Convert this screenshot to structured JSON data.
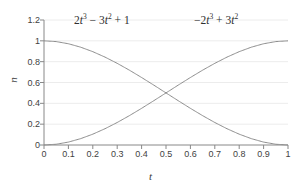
{
  "chart_data": {
    "type": "line",
    "title": "",
    "xlabel": "t",
    "ylabel": "n",
    "xlim": [
      0,
      1
    ],
    "ylim": [
      0,
      1.2
    ],
    "grid": true,
    "grid_note": "faint horizontal gridlines at each y tick",
    "legend_position": "inside-top (inline curve annotations)",
    "x_ticks": [
      "0",
      "0.1",
      "0.2",
      "0.3",
      "0.4",
      "0.5",
      "0.6",
      "0.7",
      "0.8",
      "0.9",
      "1"
    ],
    "y_ticks": [
      "0",
      "0.2",
      "0.4",
      "0.6",
      "0.8",
      "1",
      "1.2"
    ],
    "x": [
      0,
      0.05,
      0.1,
      0.15,
      0.2,
      0.25,
      0.3,
      0.35,
      0.4,
      0.45,
      0.5,
      0.55,
      0.6,
      0.65,
      0.7,
      0.75,
      0.8,
      0.85,
      0.9,
      0.95,
      1
    ],
    "series": [
      {
        "name": "2t^3 - 3t^2 + 1",
        "label_text": "2t³ − 3t² + 1",
        "color": "#8c8c8c",
        "values": [
          1,
          0.9928,
          0.972,
          0.9393,
          0.896,
          0.8438,
          0.784,
          0.7183,
          0.648,
          0.5748,
          0.5,
          0.4253,
          0.352,
          0.2818,
          0.216,
          0.1563,
          0.104,
          0.0608,
          0.028,
          0.0073,
          0
        ]
      },
      {
        "name": "-2t^3 + 3t^2",
        "label_text": "−2t³ + 3t²",
        "color": "#8c8c8c",
        "values": [
          0,
          0.0073,
          0.028,
          0.0608,
          0.104,
          0.1563,
          0.216,
          0.2818,
          0.352,
          0.4253,
          0.5,
          0.5748,
          0.648,
          0.7183,
          0.784,
          0.8438,
          0.896,
          0.9393,
          0.972,
          0.9928,
          1
        ]
      }
    ],
    "crossing_point": {
      "x": 0.5,
      "y": 0.5
    }
  },
  "annotations": {
    "curve_a": {
      "coef1": "2",
      "var1": "t",
      "exp1": "3",
      "op1": "−",
      "coef2": "3",
      "var2": "t",
      "exp2": "2",
      "op2": "+",
      "const": "1"
    },
    "curve_b": {
      "op0": "−",
      "coef1": "2",
      "var1": "t",
      "exp1": "3",
      "op1": "+",
      "coef2": "3",
      "var2": "t",
      "exp2": "2"
    }
  },
  "axes": {
    "y_label": "n",
    "x_label": "t"
  },
  "colors": {
    "curve": "#8c8c8c",
    "axis": "#7a7a7a",
    "grid": "#e8e8e8",
    "text": "#3a3a3a",
    "background": "#ffffff"
  }
}
